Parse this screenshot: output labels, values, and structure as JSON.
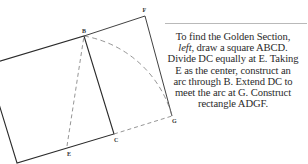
{
  "diagram": {
    "points": {
      "A": {
        "x": -13,
        "y": 65
      },
      "B": {
        "x": 84,
        "y": 36,
        "label": "B"
      },
      "C": {
        "x": 114,
        "y": 134,
        "label": "C"
      },
      "D": {
        "x": 17,
        "y": 163
      },
      "E": {
        "x": 67,
        "y": 146,
        "label": "E"
      },
      "F": {
        "x": 145,
        "y": 16,
        "label": "F"
      },
      "G": {
        "x": 172,
        "y": 116,
        "label": "G"
      }
    },
    "colors": {
      "solid_line": "#2b2b2b",
      "dashed_line": "#7a7a7a",
      "rule": "#b9b9b9",
      "text": "#2a2a2a"
    }
  },
  "caption": {
    "line1": "To find the Golden Section,",
    "line2_italic": "left",
    "line2_rest": ", draw a square ABCD.",
    "line3": "Divide DC equally at E. Taking",
    "line4": "E as the center, construct an",
    "line5": "arc through B. Extend DC to",
    "line6": "meet the arc at G. Construct",
    "line7": "rectangle ADGF."
  }
}
